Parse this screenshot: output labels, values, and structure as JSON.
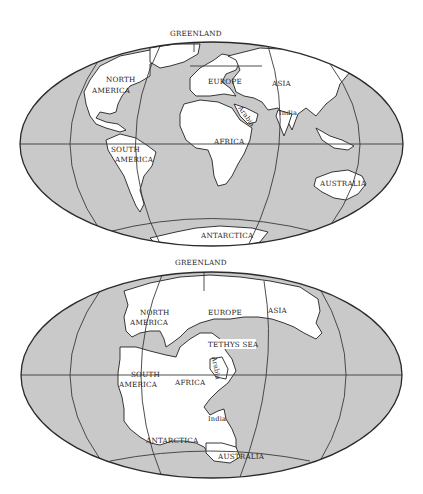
{
  "figure": {
    "panels": [
      {
        "id": "present-day",
        "labels": {
          "greenland": "GREENLAND",
          "north_america_1": "NORTH",
          "north_america_2": "AMERICA",
          "europe": "EUROPE",
          "asia": "ASIA",
          "arabia": "Arabia",
          "india": "India",
          "africa": "AFRICA",
          "south_america_1": "SOUTH",
          "south_america_2": "AMERICA",
          "australia": "AUSTRALIA",
          "antarctica": "ANTARCTICA"
        }
      },
      {
        "id": "pangaea",
        "labels": {
          "greenland": "GREENLAND",
          "north_america_1": "NORTH",
          "north_america_2": "AMERICA",
          "europe": "EUROPE",
          "asia": "ASIA",
          "tethys_sea": "TETHYS SEA",
          "arabia": "Arabia",
          "south_america_1": "SOUTH",
          "south_america_2": "AMERICA",
          "africa": "AFRICA",
          "india": "India",
          "antarctica": "ANTARCTICA",
          "australia": "AUSTRALIA"
        }
      }
    ],
    "colors": {
      "ocean": "#c9c9c9",
      "land": "#ffffff",
      "outline": "#222222"
    }
  }
}
